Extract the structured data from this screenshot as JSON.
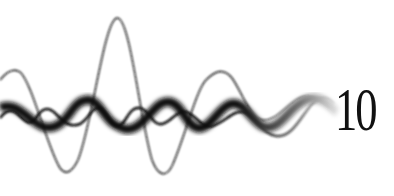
{
  "illustration": {
    "description": "waveforms",
    "chapter_number": "10",
    "colors": {
      "wave": "#111111",
      "background": "#ffffff"
    }
  }
}
